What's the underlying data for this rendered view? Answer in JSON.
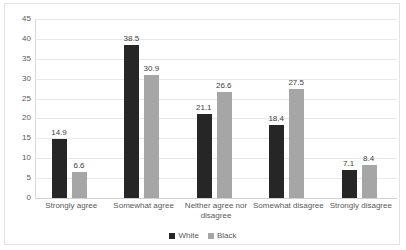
{
  "chart_data": {
    "type": "bar",
    "title": "",
    "subtitle": "",
    "xlabel": "",
    "ylabel": "",
    "ylim": [
      0,
      45
    ],
    "ytick_step": 5,
    "yticks": [
      45,
      40,
      35,
      30,
      25,
      20,
      15,
      10,
      5,
      0
    ],
    "grid": true,
    "legend_position": "bottom",
    "categories": [
      "Strongly agree",
      "Somewhat agree",
      "Neither agree nor disagree",
      "Somewhat disagree",
      "Strongly disagree"
    ],
    "category_lines": [
      [
        "Strongly agree"
      ],
      [
        "Somewhat agree"
      ],
      [
        "Neither agree nor",
        "disagree"
      ],
      [
        "Somewhat disagree"
      ],
      [
        "Strongly disagree"
      ]
    ],
    "series": [
      {
        "name": "White",
        "color": "#262626",
        "values": [
          14.9,
          38.5,
          21.1,
          18.4,
          7.1
        ]
      },
      {
        "name": "Black",
        "color": "#a6a6a6",
        "values": [
          6.6,
          30.9,
          26.6,
          27.5,
          8.4
        ]
      }
    ]
  },
  "legend": {
    "items": [
      {
        "label": "White",
        "color": "#262626"
      },
      {
        "label": "Black",
        "color": "#a6a6a6"
      }
    ]
  }
}
